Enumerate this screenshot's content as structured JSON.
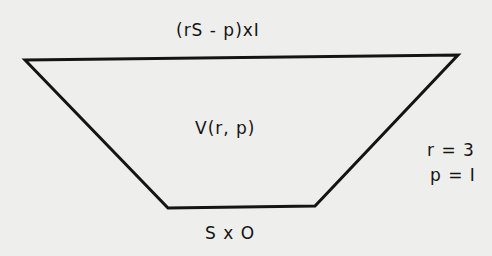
{
  "diagram": {
    "shape": "trapezoid",
    "stroke_color": "#141414",
    "background_color": "#eeeeec",
    "vertices": {
      "top_left": [
        25,
        60
      ],
      "top_right": [
        458,
        55
      ],
      "bottom_right": [
        315,
        206
      ],
      "bottom_left": [
        168,
        208
      ]
    },
    "labels": {
      "top_edge": "(rS - p)xI",
      "center": "V(r, p)",
      "bottom_edge": "S x O"
    },
    "parameters": [
      {
        "text": "r = 3"
      },
      {
        "text": "p = I"
      }
    ]
  }
}
